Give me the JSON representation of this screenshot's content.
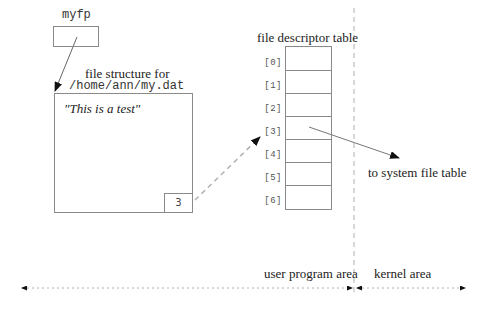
{
  "pointer": {
    "label": "myfp"
  },
  "file_structure": {
    "title_line1": "file structure for",
    "title_line2": "/home/ann/my.dat",
    "content": "\"This is a test\"",
    "fd_value": "3"
  },
  "fd_table": {
    "title": "file descriptor table",
    "entries": [
      "[0]",
      "[1]",
      "[2]",
      "[3]",
      "[4]",
      "[5]",
      "[6]"
    ]
  },
  "system_link": {
    "label": "to system file table"
  },
  "areas": {
    "user": "user program area",
    "kernel": "kernel area"
  },
  "colors": {
    "line": "#8a8a8a",
    "arrowhead": "#111111",
    "dashed": "#b0b0b0"
  }
}
